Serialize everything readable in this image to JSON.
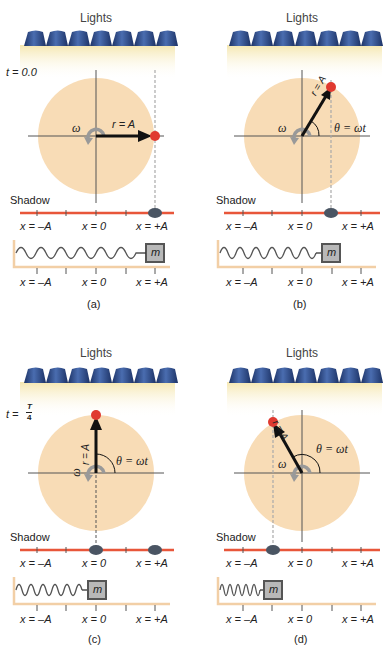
{
  "colors": {
    "lamp": "#2f4f8f",
    "lamp_dark": "#1d3366",
    "light_beam": "#f7ecc0",
    "circle": "#f8dcb6",
    "axis": "#555555",
    "shadow_line": "#e8563a",
    "shadow_blob": "#4a5563",
    "ball": "#e03a30",
    "spring_dark": "#222222",
    "spring_light": "#9a9a9a",
    "floor": "#f2cfa6",
    "mass_fill": "#b8b8b8",
    "mass_border": "#555555",
    "dashed": "#aaaaaa"
  },
  "panels": [
    {
      "id": "a",
      "caption": "(a)",
      "lights_label": "Lights",
      "time_label": "t = 0.0",
      "omega_label": "ω",
      "radius_label": "r = A",
      "angle_label": "",
      "shadow_label": "Shadow",
      "shadow_ticks": [
        "x = –A",
        "x = 0",
        "x = +A"
      ],
      "spring_ticks": [
        "x = –A",
        "x = 0",
        "x = +A"
      ],
      "mass_label": "m",
      "angle_deg": 0
    },
    {
      "id": "b",
      "caption": "(b)",
      "lights_label": "Lights",
      "time_label": "",
      "omega_label": "ω",
      "radius_label": "r = A",
      "angle_label": "θ = ωt",
      "shadow_label": "Shadow",
      "shadow_ticks": [
        "x = –A",
        "x = 0",
        "x = +A"
      ],
      "spring_ticks": [
        "x = –A",
        "x = 0",
        "x = +A"
      ],
      "mass_label": "m",
      "angle_deg": 60
    },
    {
      "id": "c",
      "caption": "(c)",
      "lights_label": "Lights",
      "time_label": "t = T/4",
      "time_numerator": "T",
      "time_denominator": "4",
      "omega_label": "ω",
      "radius_label": "r = A",
      "angle_label": "θ = ωt",
      "shadow_label": "Shadow",
      "shadow_ticks": [
        "x = –A",
        "x = 0",
        "x = +A"
      ],
      "spring_ticks": [
        "x = –A",
        "x = 0",
        "x = +A"
      ],
      "mass_label": "m",
      "angle_deg": 90
    },
    {
      "id": "d",
      "caption": "(d)",
      "lights_label": "Lights",
      "time_label": "",
      "omega_label": "ω",
      "radius_label": "r = A",
      "angle_label": "θ = ωt",
      "shadow_label": "Shadow",
      "shadow_ticks": [
        "x = –A",
        "x = 0",
        "x = +A"
      ],
      "spring_ticks": [
        "x = –A",
        "x = 0",
        "x = +A"
      ],
      "mass_label": "m",
      "angle_deg": 120
    }
  ]
}
